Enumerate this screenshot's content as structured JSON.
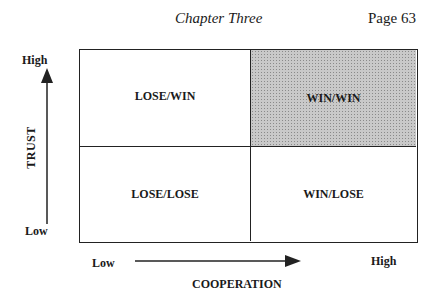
{
  "header": {
    "chapter": "Chapter Three",
    "page": "Page 63"
  },
  "matrix": {
    "top_left": "LOSE/WIN",
    "top_right": "WIN/WIN",
    "bottom_left": "LOSE/LOSE",
    "bottom_right": "WIN/LOSE",
    "highlight_color": "#c9c9c9"
  },
  "y_axis": {
    "title": "TRUST",
    "high": "High",
    "low": "Low"
  },
  "x_axis": {
    "title": "COOPERATION",
    "high": "High",
    "low": "Low"
  }
}
